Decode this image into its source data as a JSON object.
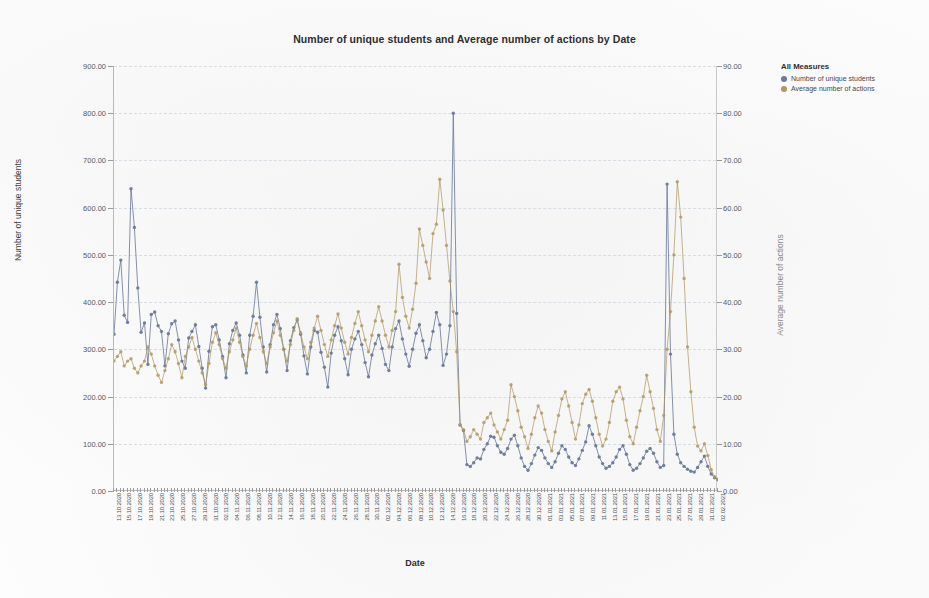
{
  "chart_data": {
    "type": "line",
    "title": "Number of unique students and Average number of actions by Date",
    "xlabel": "Date",
    "ylabel": "Number of unique students",
    "y2label": "Average number of actions",
    "ylim": [
      0,
      900
    ],
    "y2lim": [
      0,
      90
    ],
    "ytick_labels": [
      "0.00",
      "100.00",
      "200.00",
      "300.00",
      "400.00",
      "500.00",
      "600.00",
      "700.00",
      "800.00",
      "900.00"
    ],
    "y2tick_labels": [
      "0.00",
      "10.00",
      "20.00",
      "30.00",
      "40.00",
      "50.00",
      "60.00",
      "70.00",
      "80.00",
      "90.00"
    ],
    "grid": true,
    "legend_position": "right",
    "legend_title": "All Measures",
    "series": [
      {
        "name": "Number of unique students",
        "axis": "left",
        "color": "#6b7a99",
        "values": [
          332,
          442,
          489,
          372,
          357,
          640,
          558,
          430,
          336,
          356,
          268,
          374,
          379,
          350,
          338,
          265,
          333,
          354,
          360,
          320,
          275,
          260,
          324,
          338,
          352,
          306,
          260,
          218,
          296,
          348,
          352,
          320,
          285,
          240,
          312,
          340,
          356,
          330,
          288,
          250,
          330,
          370,
          442,
          368,
          305,
          252,
          310,
          352,
          374,
          344,
          300,
          255,
          318,
          346,
          362,
          332,
          286,
          248,
          305,
          340,
          336,
          294,
          262,
          220,
          292,
          330,
          348,
          318,
          280,
          246,
          300,
          322,
          338,
          310,
          272,
          242,
          288,
          312,
          330,
          302,
          268,
          255,
          305,
          344,
          360,
          322,
          290,
          264,
          300,
          334,
          352,
          318,
          282,
          300,
          338,
          378,
          352,
          266,
          290,
          350,
          800,
          376,
          140,
          128,
          56,
          52,
          60,
          70,
          68,
          88,
          100,
          116,
          114,
          96,
          82,
          78,
          90,
          110,
          118,
          96,
          70,
          52,
          44,
          58,
          76,
          92,
          86,
          70,
          58,
          50,
          62,
          80,
          96,
          88,
          72,
          60,
          54,
          68,
          86,
          104,
          138,
          120,
          96,
          72,
          58,
          48,
          52,
          60,
          72,
          88,
          96,
          78,
          56,
          44,
          48,
          58,
          70,
          84,
          90,
          80,
          62,
          50,
          54,
          650,
          290,
          120,
          78,
          60,
          52,
          46,
          42,
          40,
          50,
          62,
          74,
          52,
          36,
          28,
          24
        ]
      },
      {
        "name": "Average number of actions",
        "axis": "right",
        "color": "#b0975f",
        "values": [
          27.5,
          28.5,
          29.5,
          26.5,
          27.5,
          28.0,
          26.0,
          25.0,
          26.5,
          27.5,
          30.5,
          29.0,
          26.5,
          24.5,
          23.0,
          25.5,
          28.0,
          31.0,
          29.5,
          27.0,
          24.0,
          28.5,
          30.5,
          32.5,
          30.0,
          27.5,
          25.0,
          22.5,
          27.0,
          31.5,
          33.5,
          31.0,
          28.0,
          26.0,
          29.5,
          32.0,
          34.5,
          31.5,
          28.5,
          26.5,
          30.0,
          33.0,
          35.5,
          32.5,
          29.5,
          27.0,
          30.5,
          33.5,
          36.0,
          33.0,
          30.0,
          27.5,
          31.0,
          34.0,
          36.5,
          33.5,
          30.5,
          28.0,
          31.5,
          34.5,
          37.0,
          34.0,
          31.0,
          28.5,
          32.0,
          35.0,
          37.5,
          34.5,
          31.5,
          29.0,
          32.5,
          35.5,
          38.0,
          35.0,
          32.0,
          29.5,
          33.0,
          36.0,
          39.0,
          36.0,
          33.0,
          30.5,
          34.0,
          38.0,
          48.0,
          41.0,
          37.0,
          34.5,
          38.5,
          44.0,
          55.5,
          52.0,
          48.5,
          45.0,
          54.5,
          56.5,
          66.0,
          59.5,
          52.0,
          44.5,
          38.0,
          29.5,
          14.0,
          13.0,
          10.5,
          11.5,
          13.0,
          12.0,
          11.0,
          14.5,
          15.5,
          16.5,
          14.0,
          12.5,
          11.0,
          13.0,
          15.0,
          22.5,
          20.0,
          17.0,
          13.5,
          11.5,
          9.0,
          12.0,
          15.5,
          18.0,
          16.5,
          13.0,
          10.5,
          8.5,
          12.5,
          16.0,
          19.5,
          21.0,
          18.0,
          14.5,
          11.0,
          14.0,
          18.5,
          20.5,
          21.5,
          19.0,
          15.5,
          12.0,
          9.5,
          11.0,
          14.5,
          19.0,
          21.0,
          22.0,
          19.5,
          15.0,
          11.5,
          10.0,
          13.5,
          17.0,
          20.0,
          24.5,
          21.0,
          17.5,
          13.0,
          10.5,
          16.0,
          30.0,
          38.0,
          50.0,
          65.5,
          58.0,
          45.0,
          30.5,
          21.0,
          13.5,
          9.5,
          8.5,
          10.0,
          7.5,
          4.5,
          3.0,
          2.5
        ]
      }
    ],
    "xtick_labels": [
      "13.10.2020",
      "15.10.2020",
      "17.10.2020",
      "19.10.2020",
      "21.10.2020",
      "23.10.2020",
      "25.10.2020",
      "27.10.2020",
      "29.10.2020",
      "31.10.2020",
      "02.11.2020",
      "04.11.2020",
      "06.11.2020",
      "08.11.2020",
      "10.11.2020",
      "12.11.2020",
      "14.11.2020",
      "16.11.2020",
      "18.11.2020",
      "20.11.2020",
      "22.11.2020",
      "24.11.2020",
      "26.11.2020",
      "28.11.2020",
      "30.11.2020",
      "02.12.2020",
      "04.12.2020",
      "06.12.2020",
      "08.12.2020",
      "10.12.2020",
      "12.12.2020",
      "14.12.2020",
      "16.12.2020",
      "18.12.2020",
      "20.12.2020",
      "22.12.2020",
      "24.12.2020",
      "26.12.2020",
      "28.12.2020",
      "30.12.2020",
      "01.01.2021",
      "03.01.2021",
      "05.01.2021",
      "07.01.2021",
      "09.01.2021",
      "11.01.2021",
      "13.01.2021",
      "15.01.2021",
      "17.01.2021",
      "19.01.2021",
      "21.01.2021",
      "23.01.2021",
      "25.01.2021",
      "27.01.2021",
      "29.01.2021",
      "31.01.2021",
      "02.02.2021"
    ]
  },
  "legend": {
    "title": "All Measures",
    "items": [
      {
        "label": "Number of unique students",
        "color": "#6b7a99"
      },
      {
        "label": "Average number of actions",
        "color": "#b0975f"
      }
    ]
  }
}
